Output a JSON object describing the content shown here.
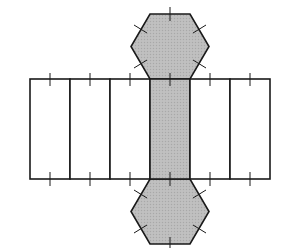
{
  "diagram": {
    "title": "",
    "colors": {
      "stroke": "#1a1a1a",
      "shaded_fill": "#b8b8b8",
      "unshaded_fill": "#ffffff",
      "background": "#ffffff"
    },
    "rectangles": [
      {
        "x": 30,
        "shaded": false
      },
      {
        "x": 70,
        "shaded": false
      },
      {
        "x": 110,
        "shaded": false
      },
      {
        "x": 150,
        "shaded": true
      },
      {
        "x": 190,
        "shaded": false
      },
      {
        "x": 230,
        "shaded": false
      }
    ],
    "rect_width": 40,
    "rect_top": 79,
    "rect_bottom": 179,
    "hexagons": [
      {
        "position": "top",
        "shaded": true
      },
      {
        "position": "bottom",
        "shaded": true
      }
    ],
    "tick_marks": "congruent-edge tick marks on every hexagon edge and on the top and bottom edges of every rectangle"
  }
}
